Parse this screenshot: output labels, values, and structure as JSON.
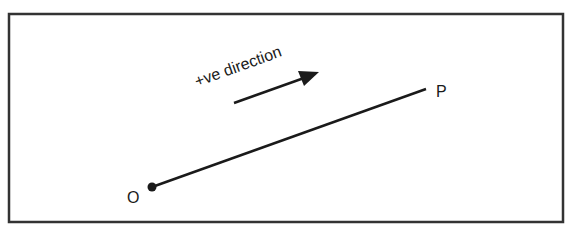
{
  "diagram": {
    "direction_label": "+ve direction",
    "point_start_label": "O",
    "point_end_label": "P",
    "colors": {
      "ink": "#1a1a1a",
      "frame": "#333333",
      "background": "#ffffff"
    }
  }
}
